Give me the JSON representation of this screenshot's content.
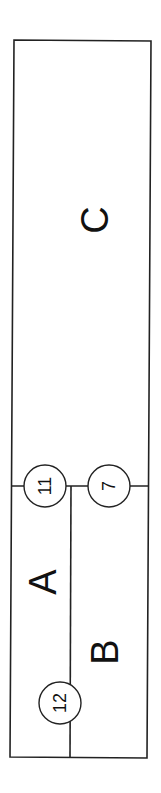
{
  "diagram": {
    "type": "floor-plan-partition",
    "orientation": "rotated-90-ccw",
    "colors": {
      "line": "#222222",
      "text": "#111111",
      "background": "#ffffff"
    },
    "regions": [
      {
        "id": "A",
        "label": "A"
      },
      {
        "id": "B",
        "label": "B"
      },
      {
        "id": "C",
        "label": "C"
      }
    ],
    "nodes": [
      {
        "id": "n11",
        "label": "11"
      },
      {
        "id": "n7",
        "label": "7"
      },
      {
        "id": "n12",
        "label": "12"
      }
    ]
  }
}
